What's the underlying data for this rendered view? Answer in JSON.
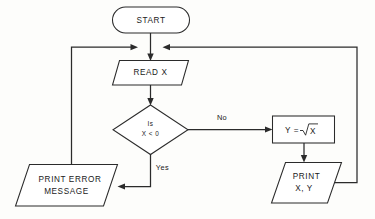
{
  "diagram": {
    "type": "flowchart",
    "colors": {
      "background": "#fdfdfb",
      "stroke": "#2b2b2b",
      "shape_fill": "#ffffff",
      "text": "#1a1a1a"
    },
    "nodes": [
      {
        "id": "start",
        "shape": "terminator",
        "label": "START",
        "lines": [
          "START"
        ]
      },
      {
        "id": "read_x",
        "shape": "parallelogram",
        "label": "READ X",
        "lines": [
          "READ X"
        ]
      },
      {
        "id": "decision",
        "shape": "diamond",
        "label": "Is X < 0",
        "lines": [
          "Is",
          "X < 0"
        ]
      },
      {
        "id": "compute_y",
        "shape": "rectangle",
        "label": "Y = √X",
        "lines": [
          "Y =",
          "X"
        ],
        "operator": "=",
        "variable": "Y",
        "radicand": "X"
      },
      {
        "id": "print_xy",
        "shape": "parallelogram",
        "label": "PRINT X, Y",
        "lines": [
          "PRINT",
          "X, Y"
        ]
      },
      {
        "id": "print_error",
        "shape": "parallelogram",
        "label": "PRINT ERROR MESSAGE",
        "lines": [
          "PRINT ERROR",
          "MESSAGE"
        ]
      }
    ],
    "edge_labels": {
      "no": "No",
      "yes": "Yes"
    },
    "edges": [
      {
        "from": "start",
        "to": "read_x",
        "label": ""
      },
      {
        "from": "read_x",
        "to": "decision",
        "label": ""
      },
      {
        "from": "decision",
        "to": "compute_y",
        "label": "No"
      },
      {
        "from": "decision",
        "to": "print_error",
        "label": "Yes"
      },
      {
        "from": "compute_y",
        "to": "print_xy",
        "label": ""
      },
      {
        "from": "print_xy",
        "to": "read_x",
        "label": ""
      },
      {
        "from": "print_error",
        "to": "read_x",
        "label": ""
      }
    ]
  }
}
